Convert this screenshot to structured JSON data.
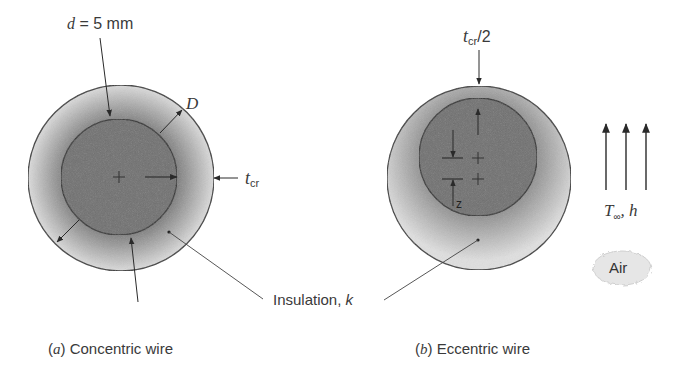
{
  "figure": {
    "panel_a": {
      "caption_letter": "a",
      "caption_text": "Concentric wire",
      "label_d_var": "d",
      "label_d_value": " = 5 mm",
      "label_D": "D",
      "label_tcr_base": "t",
      "label_tcr_sub": "cr"
    },
    "panel_b": {
      "caption_letter": "b",
      "caption_text": "Eccentric wire",
      "label_tcr2_base": "t",
      "label_tcr2_sub": "cr",
      "label_tcr2_suffix": "/2",
      "label_z": "z"
    },
    "shared": {
      "insulation_label": "Insulation, ",
      "insulation_k": "k"
    },
    "flow": {
      "label_T": "T",
      "label_inf": "∞",
      "label_h": ", h",
      "air_label": "Air"
    },
    "colors": {
      "core": "#6e6e6e",
      "insulation_outer": "#d8d8d8",
      "insulation_inner": "#8a8a8a",
      "stroke": "#3a3a3a"
    }
  }
}
